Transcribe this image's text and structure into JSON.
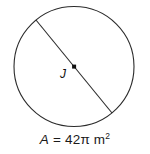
{
  "figure": {
    "type": "circle-diagram",
    "title": "",
    "background_color": "#ffffff",
    "stroke_color": "#2b2b2b",
    "label_color": "#111111",
    "circle": {
      "center_label": "J",
      "center_x": 74,
      "center_y": 66.5,
      "radius": 60
    },
    "diameter": {
      "x1": 36,
      "y1": 20,
      "x2": 112,
      "y2": 113,
      "label": ""
    },
    "center_point": {
      "marker": "square-dot",
      "size": 4
    },
    "caption": {
      "variable": "A",
      "equals": "=",
      "value": "42",
      "pi": "π",
      "unit": "m",
      "exponent": "2",
      "full_text": "A = 42π m²"
    }
  }
}
